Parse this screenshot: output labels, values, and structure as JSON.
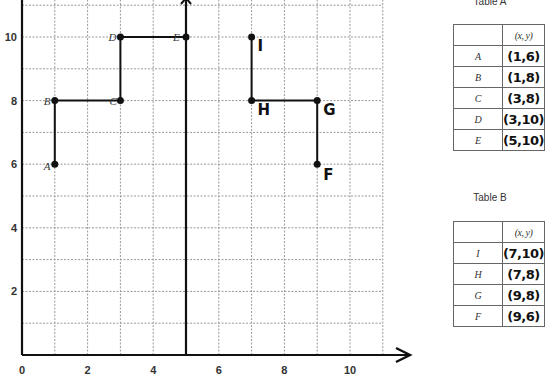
{
  "graph": {
    "x_ticks": [
      "0",
      "2",
      "4",
      "6",
      "8",
      "10"
    ],
    "y_ticks": [
      "2",
      "4",
      "6",
      "8",
      "10"
    ],
    "points": [
      {
        "label": "A",
        "x": 1,
        "y": 6,
        "style": "printed"
      },
      {
        "label": "B",
        "x": 1,
        "y": 8,
        "style": "printed"
      },
      {
        "label": "C",
        "x": 3,
        "y": 8,
        "style": "printed"
      },
      {
        "label": "D",
        "x": 3,
        "y": 10,
        "style": "printed"
      },
      {
        "label": "E",
        "x": 5,
        "y": 10,
        "style": "printed"
      },
      {
        "label": "I",
        "x": 7,
        "y": 10,
        "style": "handwritten"
      },
      {
        "label": "H",
        "x": 7,
        "y": 8,
        "style": "handwritten"
      },
      {
        "label": "G",
        "x": 9,
        "y": 8,
        "style": "handwritten"
      },
      {
        "label": "F",
        "x": 9,
        "y": 6,
        "style": "handwritten"
      }
    ],
    "mirror_line_x": 5
  },
  "table_a": {
    "title": "Table A",
    "header": "(x, y)",
    "rows": [
      {
        "point": "A",
        "value": "(1,6)"
      },
      {
        "point": "B",
        "value": "(1,8)"
      },
      {
        "point": "C",
        "value": "(3,8)"
      },
      {
        "point": "D",
        "value": "(3,10)"
      },
      {
        "point": "E",
        "value": "(5,10)"
      }
    ]
  },
  "table_b": {
    "title": "Table B",
    "header": "(x, y)",
    "rows": [
      {
        "point": "I",
        "value": "(7,10)"
      },
      {
        "point": "H",
        "value": "(7,8)"
      },
      {
        "point": "G",
        "value": "(9,8)"
      },
      {
        "point": "F",
        "value": "(9,6)"
      }
    ]
  },
  "chart_data": {
    "type": "line",
    "title": "",
    "xlabel": "",
    "ylabel": "",
    "xlim": [
      0,
      11
    ],
    "ylim": [
      0,
      11
    ],
    "x_ticks": [
      0,
      2,
      4,
      6,
      8,
      10
    ],
    "y_ticks": [
      2,
      4,
      6,
      8,
      10
    ],
    "grid": true,
    "series": [
      {
        "name": "Table A path",
        "points": [
          [
            "A",
            1,
            6
          ],
          [
            "B",
            1,
            8
          ],
          [
            "C",
            3,
            8
          ],
          [
            "D",
            3,
            10
          ],
          [
            "E",
            5,
            10
          ]
        ]
      },
      {
        "name": "Table B path",
        "points": [
          [
            "I",
            7,
            10
          ],
          [
            "H",
            7,
            8
          ],
          [
            "G",
            9,
            8
          ],
          [
            "F",
            9,
            6
          ]
        ]
      }
    ],
    "annotations": [
      "vertical line at x = 5"
    ]
  }
}
